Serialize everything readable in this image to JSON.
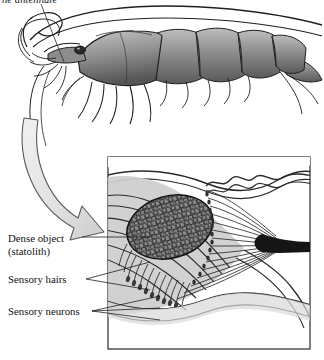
{
  "figure": {
    "kind": "scientific-illustration",
    "caption_fragment": "ne antennule",
    "background_color": "#ffffff",
    "ink_color": "#1a1a1a"
  },
  "organism": {
    "name": "shrimp",
    "parts": {
      "antennae": "long-antennae",
      "antennule": "antennule",
      "carapace": "carapace",
      "abdomen_segments": 6,
      "eye": "compound-eye",
      "walking_legs": 5,
      "tail": "telson-uropods"
    },
    "shading": {
      "body_fill": "#9a9a9a",
      "body_dark": "#4a4a4a",
      "outline": "#1a1a1a"
    }
  },
  "pointer_arrow": {
    "name": "magnify-arrow",
    "description": "curved arrow from antennule base to detail inset",
    "fill": "#e3e3e3",
    "stroke": "#555555"
  },
  "leader_line": {
    "name": "antennule-leader",
    "from": "caption",
    "to": "antennule-base"
  },
  "inset": {
    "name": "statocyst-detail",
    "border_color": "#3a3a3a",
    "background": "#ffffff",
    "tissue_fill": "#c9c9c9",
    "tissue_fill_light": "#e0e0e0",
    "statolith": {
      "label": "statolith",
      "fill": "#8f8f8f",
      "texture": "granular-pebbles",
      "texture_stroke": "#1d1d1d"
    },
    "nerve_bundle": {
      "label": "nerve-bundle",
      "fill": "#151515"
    },
    "sensory_hair_count": 34,
    "sensory_neuron_count": 34
  },
  "labels": [
    {
      "id": "dense-object",
      "line1": "Dense object",
      "line2": "(statolith)",
      "target": "statolith"
    },
    {
      "id": "sensory-hairs",
      "line1": "Sensory hairs",
      "line2": "",
      "target": "sensory-hairs"
    },
    {
      "id": "sensory-neurons",
      "line1": "Sensory neurons",
      "line2": "",
      "target": "sensory-neurons"
    }
  ]
}
